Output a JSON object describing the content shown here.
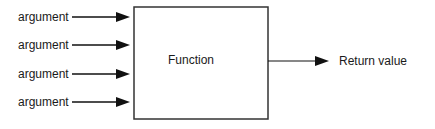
{
  "diagram": {
    "inputs": [
      {
        "label": "argument"
      },
      {
        "label": "argument"
      },
      {
        "label": "argument"
      },
      {
        "label": "argument"
      }
    ],
    "function_box": {
      "label": "Function"
    },
    "output": {
      "label": "Return value"
    },
    "colors": {
      "stroke": "#111111",
      "text": "#1a1a1a",
      "background": "#ffffff"
    }
  }
}
